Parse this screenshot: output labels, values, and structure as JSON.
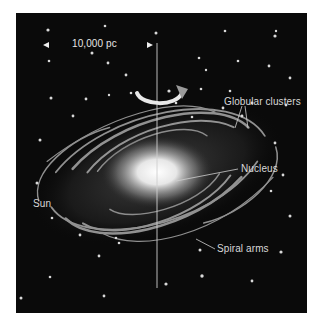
{
  "diagram": {
    "background_color": "#0a0a0a",
    "scale_bar": {
      "label": "10,000 pc"
    },
    "labels": {
      "globular_clusters": "Globular clusters",
      "nucleus": "Nucleus",
      "sun": "Sun",
      "spiral_arms": "Spiral arms"
    },
    "icons": [
      "rotation-arrow-icon",
      "scale-arrow-left-icon",
      "scale-arrow-right-icon"
    ]
  }
}
